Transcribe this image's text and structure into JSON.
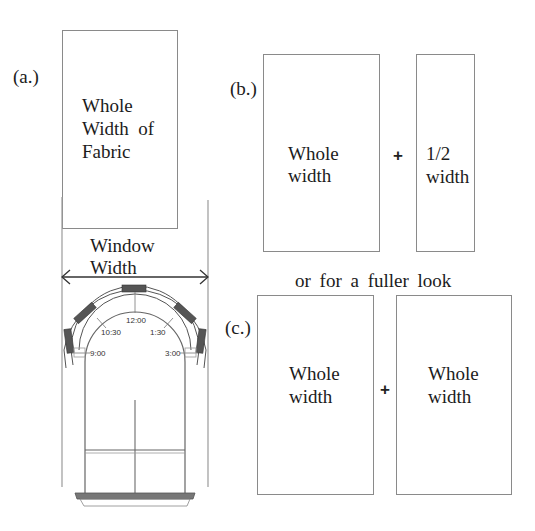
{
  "figure": {
    "panel_a": {
      "label": "(a.)",
      "fabric_text": [
        "Whole",
        "Width  of",
        "Fabric"
      ],
      "measure_label": [
        "Window",
        "Width"
      ]
    },
    "window_diagram": {
      "clock_positions": [
        "12:00",
        "10:30",
        "1:30",
        "9:00",
        "3:00"
      ]
    },
    "panel_b": {
      "label": "(b.)",
      "left_text": [
        "Whole",
        "width"
      ],
      "operator": "+",
      "right_text": [
        "1/2",
        "width"
      ]
    },
    "alternative_caption": "or for a fuller look",
    "panel_c": {
      "label": "(c.)",
      "left_text": [
        "Whole",
        "width"
      ],
      "operator": "+",
      "right_text": [
        "Whole",
        "width"
      ]
    }
  }
}
